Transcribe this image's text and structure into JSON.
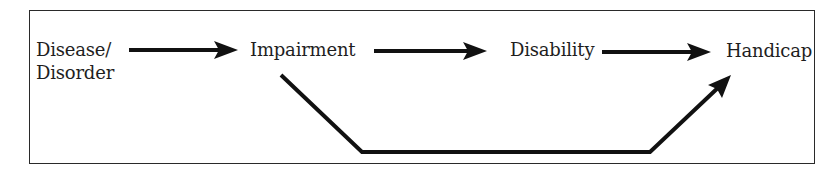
{
  "diagram": {
    "nodes": [
      {
        "id": "disease",
        "label_line1": "Disease/",
        "label_line2": "Disorder"
      },
      {
        "id": "impairment",
        "label": "Impairment"
      },
      {
        "id": "disability",
        "label": "Disability"
      },
      {
        "id": "handicap",
        "label": "Handicap"
      }
    ],
    "edges": [
      {
        "from": "disease",
        "to": "impairment"
      },
      {
        "from": "impairment",
        "to": "disability"
      },
      {
        "from": "disability",
        "to": "handicap"
      },
      {
        "from": "impairment",
        "to": "handicap",
        "route": "below"
      }
    ],
    "colors": {
      "stroke": "#111111",
      "text": "#1e1e1e",
      "frame": "#2a2a2a",
      "background": "#ffffff"
    }
  }
}
